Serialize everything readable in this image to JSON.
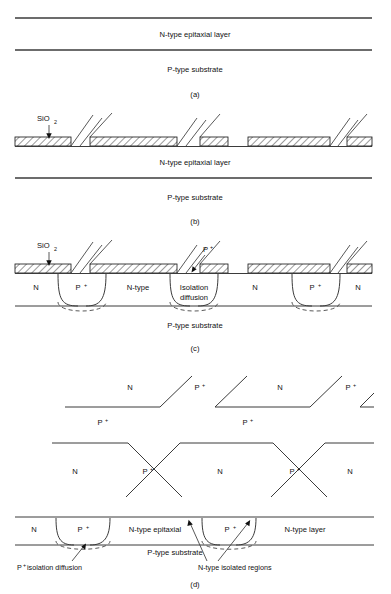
{
  "figure": {
    "panels": [
      {
        "tag": "(a)",
        "layers": [
          {
            "name": "epitaxial",
            "label": "N-type epitaxial layer"
          },
          {
            "name": "substrate",
            "label": "P-type substrate"
          }
        ]
      },
      {
        "tag": "(b)",
        "oxide_label": "SiO",
        "oxide_sub": "2",
        "layers": [
          {
            "name": "epitaxial",
            "label": "N-type epitaxial layer"
          },
          {
            "name": "substrate",
            "label": "P-type substrate"
          }
        ]
      },
      {
        "tag": "(c)",
        "oxide_label": "SiO",
        "oxide_sub": "2",
        "pplus_label": "P",
        "pplus_sup": "+",
        "regions": [
          {
            "label": "N"
          },
          {
            "label": "P",
            "sup": "+"
          },
          {
            "label": "N-type"
          },
          {
            "label": "Isolation",
            "label2": "diffusion"
          },
          {
            "label": "N"
          },
          {
            "label": "P",
            "sup": "+"
          },
          {
            "label": "N"
          }
        ],
        "substrate_label": "P-type substrate"
      },
      {
        "tag": "(d)",
        "top_face_labels": [
          {
            "label": "N"
          },
          {
            "label": "P",
            "sup": "+"
          },
          {
            "label": "N"
          },
          {
            "label": "P",
            "sup": "+"
          },
          {
            "label": "P",
            "sup": "+"
          },
          {
            "label": "P",
            "sup": "+"
          }
        ],
        "front_face_labels": [
          {
            "label": "N"
          },
          {
            "label": "P",
            "sup": "+"
          },
          {
            "label": "N"
          },
          {
            "label": "P",
            "sup": "+"
          },
          {
            "label": "N"
          }
        ],
        "edge_labels": [
          {
            "label": "N"
          },
          {
            "label": "P",
            "sup": "+"
          },
          {
            "label": "N-type epitaxial"
          },
          {
            "label": "P",
            "sup": "+"
          },
          {
            "label": "N-type layer"
          }
        ],
        "substrate_label": "P-type substrate",
        "callouts": [
          {
            "label": "P",
            "sup": "+",
            "rest": " isolation diffusion"
          },
          {
            "label": "N-type isolated regions"
          }
        ]
      }
    ]
  },
  "colors": {
    "line": "#3b3b3b",
    "ink": "#111111",
    "background": "#ffffff"
  }
}
